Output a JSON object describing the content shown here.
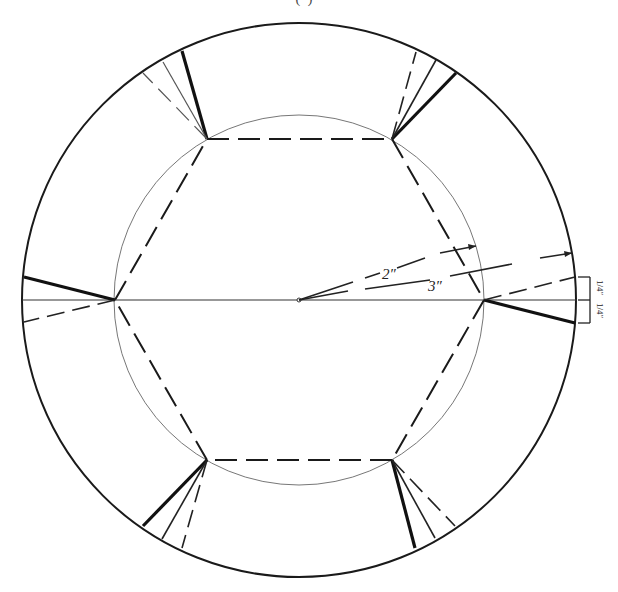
{
  "caption_fragment": "(                 )",
  "diagram": {
    "colors": {
      "ink": "#1a1a1a",
      "thin": "#555555",
      "background": "#ffffff"
    },
    "outer_circle": {
      "cx": 299,
      "cy": 300,
      "r": 277
    },
    "inner_circle": {
      "cx": 299,
      "cy": 300,
      "r": 185
    },
    "hexagon_vertices": [
      [
        207,
        139
      ],
      [
        392,
        139
      ],
      [
        484,
        300
      ],
      [
        392,
        460
      ],
      [
        207,
        460
      ],
      [
        115,
        300
      ]
    ],
    "labels": {
      "inner_radius": "2″",
      "outer_radius": "3″",
      "offset_top": "1/4″",
      "offset_bottom": "1/4″"
    }
  }
}
